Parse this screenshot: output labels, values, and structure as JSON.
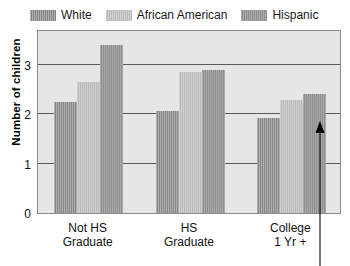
{
  "chart_data": {
    "type": "bar",
    "title": "",
    "xlabel": "",
    "ylabel": "Number of children",
    "categories": [
      "Not HS Graduate",
      "HS Graduate",
      "College 1 Yr +"
    ],
    "category_lines": [
      [
        "Not HS",
        "Graduate"
      ],
      [
        "HS",
        "Graduate"
      ],
      [
        "College",
        "1 Yr +"
      ]
    ],
    "series": [
      {
        "name": "White",
        "values": [
          2.25,
          2.07,
          1.92
        ],
        "color": "#8d8d8d"
      },
      {
        "name": "African American",
        "values": [
          2.65,
          2.85,
          2.28
        ],
        "color": "#c2c2c2"
      },
      {
        "name": "Hispanic",
        "values": [
          3.4,
          2.9,
          2.4
        ],
        "color": "#969696"
      }
    ],
    "yticks": [
      0,
      1,
      2,
      3
    ],
    "ytick_labels": [
      "0",
      "1",
      "2",
      "3"
    ],
    "ylim": [
      0,
      3.72
    ],
    "grid": true,
    "gridlines_at": [
      1,
      2,
      3
    ],
    "legend_position": "top-left",
    "plot_background": "#e6e6e6",
    "gridline_color": "#5a5a5a",
    "frame_color": "#8a8a8a"
  },
  "legend": {
    "entries": [
      {
        "label": "White"
      },
      {
        "label": "African American"
      },
      {
        "label": "Hispanic"
      }
    ]
  },
  "annotation": {
    "arrow": {
      "name": "callout-arrow",
      "direction": "up",
      "x": 320,
      "tip_y": 121,
      "tail_y": 266,
      "color": "#000000"
    }
  }
}
